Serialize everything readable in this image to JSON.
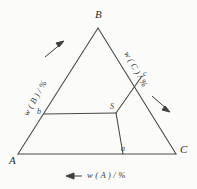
{
  "figure": {
    "type": "ternary-phase-diagram",
    "background_color": "#fbfbf9",
    "line_color": "#4a4a4a",
    "text_color": "#3a3a3a",
    "vertices": [
      {
        "id": "A",
        "label": "A",
        "position": "bottom-left"
      },
      {
        "id": "B",
        "label": "B",
        "position": "top"
      },
      {
        "id": "C",
        "label": "C",
        "position": "bottom-right"
      }
    ],
    "interior_point": {
      "id": "S",
      "label": "S"
    },
    "edge_points": [
      {
        "id": "a",
        "label": "a",
        "on_edge": "AC"
      },
      {
        "id": "b",
        "label": "b",
        "on_edge": "AB"
      },
      {
        "id": "c",
        "label": "c",
        "on_edge": "BC"
      }
    ],
    "axes": [
      {
        "id": "axis-b",
        "label": "w ( B ) / %",
        "edge": "AB",
        "arrow_direction": "up-right",
        "arrow_glyph": "→"
      },
      {
        "id": "axis-c",
        "label": "w ( C ) / %",
        "edge": "BC",
        "arrow_direction": "down-right",
        "arrow_glyph": "→"
      },
      {
        "id": "axis-a",
        "label": "w ( A ) / %",
        "edge": "AC",
        "arrow_direction": "left",
        "arrow_glyph": "←"
      }
    ],
    "construction_lines": [
      {
        "from": "b",
        "to": "S",
        "kind": "horizontal-tie-line"
      },
      {
        "from": "S",
        "to": "c",
        "kind": "tie-line"
      },
      {
        "from": "S",
        "to": "a",
        "kind": "tie-line"
      }
    ]
  }
}
